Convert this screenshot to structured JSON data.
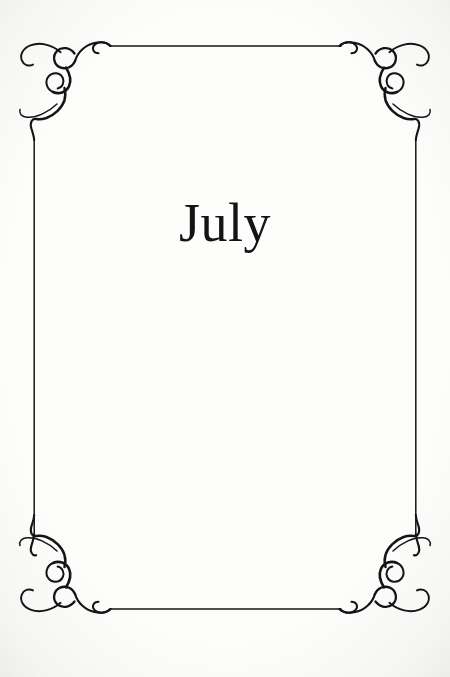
{
  "page": {
    "title": "July",
    "background_color": "#fdfdfc",
    "ink_color": "#141414"
  },
  "frame": {
    "style_name": "filigree-scroll-border",
    "stroke_color": "#141414",
    "rule_thickness_px": 1.6,
    "top_rule": {
      "x1": 110,
      "x2": 341,
      "y": 46
    },
    "bottom_rule": {
      "x1": 110,
      "x2": 341,
      "y": 609
    },
    "left_rule": {
      "x": 34,
      "y1": 140,
      "y2": 534
    },
    "right_rule": {
      "x": 415,
      "y1": 140,
      "y2": 534
    },
    "corners": [
      {
        "name": "top-left-ornament",
        "x": 18,
        "y": 30
      },
      {
        "name": "top-right-ornament",
        "x": 332,
        "y": 30
      },
      {
        "name": "bottom-left-ornament",
        "x": 18,
        "y": 527
      },
      {
        "name": "bottom-right-ornament",
        "x": 332,
        "y": 527
      }
    ]
  }
}
